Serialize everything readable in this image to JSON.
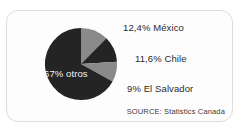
{
  "card": {
    "clipped_heading": "",
    "source_note": "SOURCE: Statistics Canada"
  },
  "colors": {
    "slice_dark": "#242424",
    "slice_gray": "#8a8a8a",
    "card_background": "#fdfdfd",
    "card_border": "#dcdcdc",
    "label_text": "#2b2b2b",
    "inner_label_text": "#f2f2f2"
  },
  "labels": {
    "mexico": "12,4% México",
    "chile": "11,6% Chile",
    "el_salvador": "9% El Salvador",
    "otros": "67% otros"
  },
  "chart_data": {
    "type": "pie",
    "title": "",
    "subtitle": "",
    "xlabel": "",
    "ylabel": "",
    "legend_position": "callout-labels-right",
    "grid": false,
    "start_angle_deg": 0,
    "direction": "clockwise",
    "categories": [
      "México",
      "Chile",
      "El Salvador",
      "otros"
    ],
    "values": [
      12.4,
      11.6,
      9,
      67
    ],
    "value_suffix": "%",
    "data_labels": [
      "12,4% México",
      "11,6% Chile",
      "9% El Salvador",
      "67% otros"
    ],
    "slices": [
      {
        "name": "México",
        "value": 12.4,
        "label": "12,4% México",
        "color": "#8a8a8a",
        "label_placement": "outside-right"
      },
      {
        "name": "Chile",
        "value": 11.6,
        "label": "11,6% Chile",
        "color": "#242424",
        "label_placement": "outside-right"
      },
      {
        "name": "El Salvador",
        "value": 9,
        "label": "9% El Salvador",
        "color": "#8a8a8a",
        "label_placement": "outside-right"
      },
      {
        "name": "otros",
        "value": 67,
        "label": "67% otros",
        "color": "#242424",
        "label_placement": "inside"
      }
    ],
    "annotations": [
      "SOURCE: Statistics Canada"
    ]
  }
}
